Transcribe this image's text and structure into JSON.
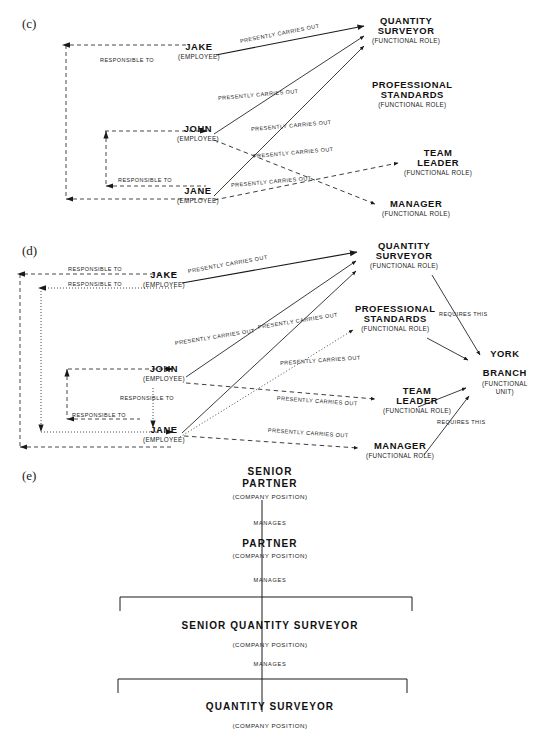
{
  "figure": {
    "panels": [
      {
        "letter": "(c)",
        "nodes": [
          {
            "name": "JAKE",
            "type": "(EMPLOYEE)"
          },
          {
            "name": "JOHN",
            "type": "(EMPLOYEE)"
          },
          {
            "name": "JANE",
            "type": "(EMPLOYEE)"
          },
          {
            "name": "QUANTITY SURVEYOR",
            "type": "(FUNCTIONAL ROLE)"
          },
          {
            "name": "PROFESSIONAL STANDARDS",
            "type": "(FUNCTIONAL ROLE)"
          },
          {
            "name": "TEAM LEADER",
            "type": "(FUNCTIONAL ROLE)"
          },
          {
            "name": "MANAGER",
            "type": "(FUNCTIONAL ROLE)"
          }
        ],
        "edges": [
          {
            "label": "PRESENTLY CARRIES OUT",
            "from": "JAKE",
            "to": "QUANTITY SURVEYOR",
            "style": "solid"
          },
          {
            "label": "PRESENTLY CARRIES OUT",
            "from": "JOHN",
            "to": "QUANTITY SURVEYOR",
            "style": "solid"
          },
          {
            "label": "PRESENTLY CARRIES OUT",
            "from": "JANE",
            "to": "QUANTITY SURVEYOR",
            "style": "solid"
          },
          {
            "label": "PRESENTLY CARRIES OUT",
            "from": "JOHN",
            "to": "TEAM LEADER",
            "style": "dashed"
          },
          {
            "label": "PRESENTLY CARRIES OUT",
            "from": "JANE",
            "to": "MANAGER",
            "style": "dashed"
          },
          {
            "label": "RESPONSIBLE TO",
            "from": "JAKE",
            "to": "spine",
            "style": "dashed"
          },
          {
            "label": "RESPONSIBLE TO",
            "from": "JANE",
            "to": "spine",
            "style": "dashed"
          }
        ],
        "edge_labels": [
          "PRESENTLY CARRIES OUT",
          "PRESENTLY CARRIES OUT",
          "PRESENTLY CARRIES OUT",
          "PRESENTLY CARRIES OUT",
          "PRESENTLY CARRIES OUT",
          "RESPONSIBLE TO",
          "RESPONSIBLE TO"
        ]
      },
      {
        "letter": "(d)",
        "nodes": [
          {
            "name": "JAKE",
            "type": "(EMPLOYEE)"
          },
          {
            "name": "JOHN",
            "type": "(EMPLOYEE)"
          },
          {
            "name": "JANE",
            "type": "(EMPLOYEE)"
          },
          {
            "name": "QUANTITY SURVEYOR",
            "type": "(FUNCTIONAL ROLE)"
          },
          {
            "name": "PROFESSIONAL STANDARDS",
            "type": "(FUNCTIONAL ROLE)"
          },
          {
            "name": "TEAM LEADER",
            "type": "(FUNCTIONAL ROLE)"
          },
          {
            "name": "MANAGER",
            "type": "(FUNCTIONAL ROLE)"
          },
          {
            "name": "YORK BRANCH",
            "type": "(FUNCTIONAL UNIT)"
          }
        ],
        "edge_labels": [
          "RESPONSIBLE TO",
          "RESPONSIBLE TO",
          "RESPONSIBLE TO",
          "RESPONSIBLE TO",
          "PRESENTLY CARRIES OUT",
          "PRESENTLY CARRIES OUT",
          "PRESENTLY CARRIES OUT",
          "PRESENTLY CARRIES OUT",
          "PRESENTLY CARRIES OUT",
          "PRESENTLY CARRIES OUT",
          "REQUIRES THIS",
          "REQUIRES THIS"
        ]
      },
      {
        "letter": "(e)",
        "type_label": "(COMPANY POSITION)",
        "relation_label": "MANAGES",
        "levels": [
          {
            "name_line1": "SENIOR",
            "name_line2": "PARTNER",
            "type": "(COMPANY  POSITION)"
          },
          {
            "name_line1": "PARTNER",
            "name_line2": "",
            "type": "(COMPANY  POSITION)"
          },
          {
            "name_line1": "SENIOR QUANTITY SURVEYOR",
            "name_line2": "",
            "type": "(COMPANY  POSITION)"
          },
          {
            "name_line1": "QUANTITY SURVEYOR",
            "name_line2": "",
            "type": "(COMPANY  POSITION)"
          }
        ],
        "relations": [
          "MANAGES",
          "MANAGES",
          "MANAGES"
        ]
      }
    ],
    "labels": {
      "presently_carries_out": "PRESENTLY  CARRIES  OUT",
      "responsible_to": "RESPONSIBLE  TO",
      "requires_this": "REQUIRES  THIS",
      "manages": "MANAGES",
      "employee": "(EMPLOYEE)",
      "functional_role": "(FUNCTIONAL  ROLE)",
      "functional_unit_l1": "(FUNCTIONAL",
      "functional_unit_l2": "UNIT)",
      "company_position": "(COMPANY  POSITION)"
    },
    "names": {
      "jake": "JAKE",
      "john": "JOHN",
      "jane": "JANE",
      "quantity_l1": "QUANTITY",
      "quantity_l2": "SURVEYOR",
      "prof_l1": "PROFESSIONAL",
      "prof_l2": "STANDARDS",
      "team_l1": "TEAM",
      "team_l2": "LEADER",
      "manager": "MANAGER",
      "york_l1": "YORK",
      "york_l2": "BRANCH",
      "senior": "SENIOR",
      "partner": "PARTNER",
      "senior_qs": "SENIOR  QUANTITY  SURVEYOR",
      "qs": "QUANTITY  SURVEYOR"
    },
    "colors": {
      "ink": "#1a1a1a",
      "background": "#ffffff"
    }
  }
}
